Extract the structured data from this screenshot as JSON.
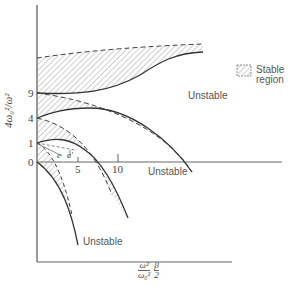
{
  "figure": {
    "legend": {
      "label": "Stable region",
      "pattern": "diagonal-hatch"
    },
    "regions": [
      {
        "label": "Unstable",
        "position": "upper"
      },
      {
        "label": "Unstable",
        "position": "right-of-axis"
      },
      {
        "label": "Unstable",
        "position": "lower"
      }
    ],
    "y_axis": {
      "label": "4ω₀²/ω²",
      "ticks": [
        "9",
        "4",
        "1",
        "0"
      ]
    },
    "x_axis": {
      "label_fraction_num": "ω²",
      "label_fraction_den": "ω₀²",
      "label_fraction2_num": "β",
      "label_fraction2_den": "2",
      "ticks": [
        "5",
        "10"
      ]
    },
    "annotations": {
      "e": "e",
      "e_prime": "e′"
    },
    "colors": {
      "line": "#333333",
      "hatch": "#777777",
      "axis": "#555555",
      "background": "#ffffff"
    }
  }
}
